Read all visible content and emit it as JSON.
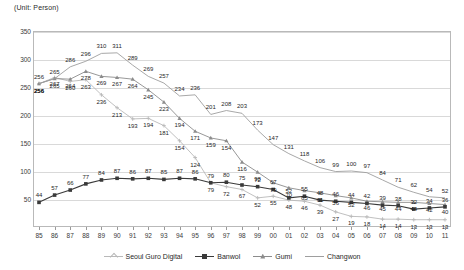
{
  "unit_note": "(Unit: Person)",
  "chart_data": {
    "type": "line",
    "title": "",
    "subtitle": "",
    "xlabel": "",
    "ylabel": "",
    "unit": "(Unit: Person)",
    "grid": true,
    "legend_position": "bottom",
    "ylim": [
      0,
      350
    ],
    "yticks": [
      50,
      100,
      150,
      200,
      250,
      300,
      350
    ],
    "categories": [
      "85",
      "86",
      "87",
      "88",
      "89",
      "90",
      "91",
      "92",
      "93",
      "94",
      "95",
      "96",
      "97",
      "98",
      "99",
      "00",
      "01",
      "02",
      "03",
      "04",
      "05",
      "06",
      "07",
      "08",
      "09",
      "10",
      "11"
    ],
    "series": [
      {
        "name": "Seoul Guro Digital",
        "color": "#b9b9b9",
        "marker": "cross",
        "values": [
          256,
          267,
          260,
          263,
          236,
          213,
          193,
          194,
          181,
          154,
          124,
          79,
          72,
          67,
          52,
          55,
          48,
          46,
          39,
          27,
          19,
          18,
          14,
          14,
          13,
          13,
          13
        ],
        "labels": [
          256,
          267,
          260,
          263,
          236,
          213,
          193,
          194,
          181,
          154,
          124,
          79,
          72,
          67,
          52,
          55,
          48,
          46,
          39,
          27,
          19,
          18,
          14,
          14,
          13,
          13,
          13
        ]
      },
      {
        "name": "Banwol",
        "color": "#3a3a3a",
        "marker": "square",
        "values": [
          44,
          57,
          66,
          77,
          84,
          87,
          86,
          87,
          85,
          87,
          86,
          79,
          80,
          75,
          72,
          67,
          52,
          55,
          48,
          46,
          44,
          42,
          39,
          38,
          32,
          34,
          36
        ],
        "labels": [
          44,
          57,
          66,
          77,
          84,
          87,
          86,
          87,
          85,
          87,
          86,
          79,
          80,
          75,
          72,
          67,
          52,
          55,
          48,
          46,
          44,
          42,
          39,
          38,
          32,
          34,
          36
        ]
      },
      {
        "name": "Gumi",
        "color": "#8c8c8c",
        "marker": "triangle",
        "values": [
          256,
          265,
          264,
          278,
          269,
          267,
          264,
          245,
          223,
          194,
          171,
          159,
          154,
          116,
          98,
          79,
          70,
          65,
          61,
          56,
          52,
          46,
          45,
          44,
          44,
          42,
          40
        ],
        "labels": [
          256,
          265,
          264,
          278,
          269,
          267,
          264,
          245,
          223,
          194,
          171,
          159,
          154,
          116,
          98,
          79,
          70,
          65,
          61,
          56,
          52,
          46,
          45,
          44,
          44,
          42,
          40
        ]
      },
      {
        "name": "Changwon",
        "color": "#9e9e9e",
        "marker": "none",
        "values": [
          256,
          265,
          286,
          296,
          310,
          311,
          289,
          269,
          257,
          234,
          236,
          201,
          208,
          203,
          173,
          147,
          131,
          118,
          106,
          99,
          100,
          97,
          84,
          71,
          62,
          54,
          52
        ],
        "labels": [
          256,
          265,
          286,
          296,
          310,
          311,
          289,
          269,
          257,
          234,
          236,
          201,
          208,
          203,
          173,
          147,
          131,
          118,
          106,
          99,
          100,
          97,
          84,
          71,
          62,
          54,
          52
        ]
      }
    ],
    "legend": [
      "Seoul Guro Digital",
      "Banwol",
      "Gumi",
      "Changwon"
    ]
  }
}
